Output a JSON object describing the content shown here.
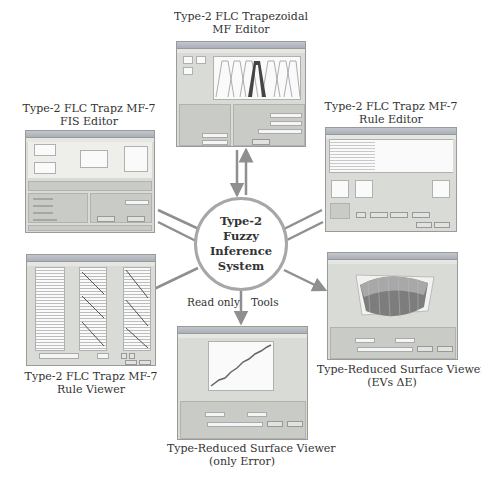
{
  "center": {
    "line1": "Type-2",
    "line2": "Fuzzy",
    "line3": "Inference",
    "line4": "System"
  },
  "edge_labels": {
    "read_only": "Read only",
    "tools": "Tools"
  },
  "nodes": {
    "mf_editor": {
      "title1": "Type-2 FLC Trapezoidal",
      "title2": "MF Editor"
    },
    "fis_editor": {
      "title1": "Type-2 FLC Trapz MF-7",
      "title2": "FIS Editor"
    },
    "rule_editor": {
      "title1": "Type-2 FLC Trapz MF-7",
      "title2": "Rule Editor"
    },
    "rule_viewer": {
      "title1": "Type-2 FLC Trapz MF-7",
      "title2": "Rule Viewer"
    },
    "surface_evs": {
      "title1": "Type-Reduced Surface Viewer",
      "title2": "(EVs ΔE)"
    },
    "surface_error": {
      "title1": "Type-Reduced Surface Viewer",
      "title2": "(only Error)"
    }
  },
  "colors": {
    "connector": "#8f8f8f",
    "window_bg": "#d9dcd6",
    "circle_border": "#a7a7a7"
  }
}
